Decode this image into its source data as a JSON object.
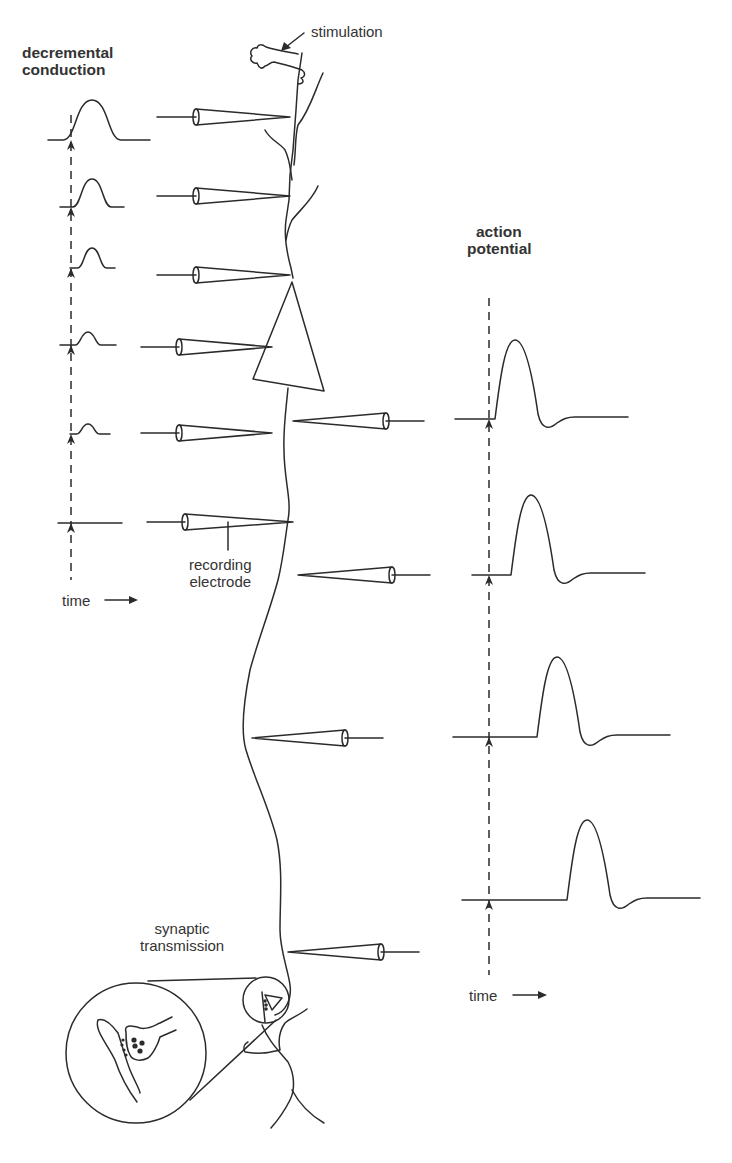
{
  "labels": {
    "decremental": [
      "decremental",
      "conduction"
    ],
    "stimulation": "stimulation",
    "action_potential": [
      "action",
      "potential"
    ],
    "recording_electrode": [
      "recording",
      "electrode"
    ],
    "time_left": "time",
    "time_right": "time",
    "synaptic": [
      "synaptic",
      "transmission"
    ]
  },
  "decremental_traces": [
    {
      "baseline_y": 140,
      "x0": 48,
      "x1": 150,
      "peak_x": 92,
      "height": 40,
      "width": 18
    },
    {
      "baseline_y": 207,
      "x0": 60,
      "x1": 124,
      "peak_x": 92,
      "height": 28,
      "width": 12
    },
    {
      "baseline_y": 268,
      "x0": 70,
      "x1": 115,
      "peak_x": 92,
      "height": 20,
      "width": 9
    },
    {
      "baseline_y": 345,
      "x0": 60,
      "x1": 116,
      "peak_x": 88,
      "height": 13,
      "width": 8
    },
    {
      "baseline_y": 434,
      "x0": 70,
      "x1": 110,
      "peak_x": 88,
      "height": 10,
      "width": 7
    },
    {
      "baseline_y": 523,
      "x0": 58,
      "x1": 122,
      "peak_x": 88,
      "height": 0,
      "width": 6
    }
  ],
  "decremental_axis": {
    "x": 71,
    "y_top": 115,
    "y_bottom": 580
  },
  "action_potential_traces": [
    {
      "baseline_y": 419,
      "x0": 455,
      "start_x": 495,
      "end_x": 628,
      "peak_y": 340
    },
    {
      "baseline_y": 575,
      "x0": 472,
      "start_x": 511,
      "end_x": 645,
      "peak_y": 495
    },
    {
      "baseline_y": 737,
      "x0": 453,
      "start_x": 537,
      "end_x": 670,
      "peak_y": 657
    },
    {
      "baseline_y": 900,
      "x0": 462,
      "start_x": 567,
      "end_x": 700,
      "peak_y": 820
    }
  ],
  "action_potential_axis": {
    "x": 489,
    "y_top": 298,
    "y_bottom": 975
  },
  "electrodes_left": [
    {
      "tip_x": 290,
      "y": 117,
      "base_x": 196,
      "wire_x0": 157
    },
    {
      "tip_x": 290,
      "y": 196,
      "base_x": 196,
      "wire_x0": 157
    },
    {
      "tip_x": 290,
      "y": 275,
      "base_x": 196,
      "wire_x0": 157
    },
    {
      "tip_x": 272,
      "y": 347,
      "base_x": 179,
      "wire_x0": 141
    },
    {
      "tip_x": 272,
      "y": 433,
      "base_x": 179,
      "wire_x0": 141
    },
    {
      "tip_x": 293,
      "y": 522,
      "base_x": 185,
      "wire_x0": 147
    }
  ],
  "electrodes_right": [
    {
      "tip_x": 293,
      "y": 421,
      "base_x": 386,
      "wire_x1": 424
    },
    {
      "tip_x": 298,
      "y": 575,
      "base_x": 392,
      "wire_x1": 430
    },
    {
      "tip_x": 252,
      "y": 738,
      "base_x": 345,
      "wire_x1": 383
    },
    {
      "tip_x": 288,
      "y": 952,
      "base_x": 381,
      "wire_x1": 419
    }
  ]
}
